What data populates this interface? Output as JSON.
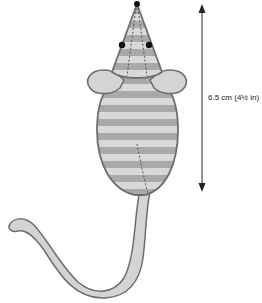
{
  "figure": {
    "measurement_label": "6.5 cm (4½ in)",
    "colors": {
      "outline": "#6e6e6e",
      "stripe_light": "#d9d9d9",
      "stripe_dark": "#a9a9a9",
      "tail_fill": "#d4d4d4",
      "eye": "#111111",
      "arrow": "#222222"
    }
  }
}
